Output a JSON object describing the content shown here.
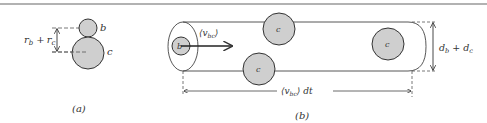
{
  "figure": {
    "panel_a": {
      "caption": "(a)",
      "small_circle_label": "b",
      "large_circle_label": "c",
      "distance_label_main1": "r",
      "distance_label_sub1": "b",
      "distance_label_plus": "+",
      "distance_label_main2": "r",
      "distance_label_sub2": "c"
    },
    "panel_b": {
      "caption": "(b)",
      "moving_particle_label": "b",
      "velocity_label_main": "⟨v",
      "velocity_label_sub": "bc",
      "velocity_label_close": "⟩",
      "target_particle_label": "c",
      "length_label_main": "⟨v",
      "length_label_sub": "bc",
      "length_label_close": "⟩ dt",
      "diameter_label_main1": "d",
      "diameter_label_sub1": "b",
      "diameter_label_plus": "+",
      "diameter_label_main2": "d",
      "diameter_label_sub2": "c"
    },
    "colors": {
      "particle_fill": "#cfcfcf",
      "stroke": "#333333",
      "rule": "#666666"
    }
  }
}
